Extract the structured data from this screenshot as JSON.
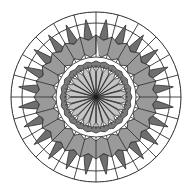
{
  "figure": {
    "title": "Radial Mandala Rosette Diagram",
    "kind": "radial-polar-rosette",
    "width": 193,
    "height": 192,
    "background": "#ffffff",
    "center": {
      "x": 96,
      "y": 97
    },
    "segments": 24,
    "stroke_color": "#2b2b2b",
    "stroke_width": 0.9
  },
  "palette": {
    "white": "#ffffff",
    "light_gray": "#c4c4c4",
    "mid_gray": "#9a9a9a",
    "dark_gray": "#7a7a7a",
    "outline": "#2b2b2b",
    "spike_fill": "#6f6f6f"
  },
  "rings": [
    {
      "name": "outer-boundary-ring",
      "label": "Outer boundary circle",
      "inner_radius": 74,
      "outer_radius": 85,
      "fill": "#ffffff",
      "has_radial_dividers": true,
      "divider_count": 24
    },
    {
      "name": "spike-band",
      "label": "Outward pointing spike band",
      "inner_radius": 58,
      "outer_radius": 78,
      "fill": "#6f6f6f",
      "spike_count": 24,
      "spike_tip_radius": 78,
      "spike_base_radius": 58
    },
    {
      "name": "scalloped-annulus",
      "label": "Scalloped mid gray annulus",
      "inner_radius": 40,
      "outer_radius": 62,
      "fill": "#9a9a9a",
      "scallop_count": 24
    },
    {
      "name": "white-gap-ring",
      "label": "White separation gap",
      "inner_radius": 34,
      "outer_radius": 42,
      "fill": "#ffffff"
    },
    {
      "name": "inner-dark-ring",
      "label": "Inner dark ring",
      "inner_radius": 30,
      "outer_radius": 36,
      "fill": "#7a7a7a"
    },
    {
      "name": "center-rosette",
      "label": "Central light gray petal rosette",
      "inner_radius": 0,
      "outer_radius": 32,
      "fill": "#c4c4c4",
      "petal_count": 24
    }
  ],
  "chart_data": {
    "type": "area",
    "title": "Radial Mandala Rosette Diagram",
    "subtitle": "",
    "xlabel": "",
    "ylabel": "",
    "grid": true,
    "legend": "none",
    "categories": [
      "0",
      "15",
      "30",
      "45",
      "60",
      "75",
      "90",
      "105",
      "120",
      "135",
      "150",
      "165",
      "180",
      "195",
      "210",
      "225",
      "240",
      "255",
      "270",
      "285",
      "300",
      "315",
      "330",
      "345"
    ],
    "xlim": [
      0,
      360
    ],
    "ylim": [
      0,
      86
    ],
    "series": [
      {
        "name": "outer-boundary",
        "color": "#ffffff",
        "values": [
          85,
          85,
          85,
          85,
          85,
          85,
          85,
          85,
          85,
          85,
          85,
          85,
          85,
          85,
          85,
          85,
          85,
          85,
          85,
          85,
          85,
          85,
          85,
          85
        ]
      },
      {
        "name": "spike-band-tips",
        "color": "#6f6f6f",
        "values": [
          78,
          58,
          78,
          58,
          78,
          58,
          78,
          58,
          78,
          58,
          78,
          58,
          78,
          58,
          78,
          58,
          78,
          58,
          78,
          58,
          78,
          58,
          78,
          58
        ]
      },
      {
        "name": "scalloped-annulus",
        "color": "#9a9a9a",
        "values": [
          62,
          58,
          62,
          58,
          62,
          58,
          62,
          58,
          62,
          58,
          62,
          58,
          62,
          58,
          62,
          58,
          62,
          58,
          62,
          58,
          62,
          58,
          62,
          58
        ]
      },
      {
        "name": "inner-dark-ring",
        "color": "#7a7a7a",
        "values": [
          36,
          36,
          36,
          36,
          36,
          36,
          36,
          36,
          36,
          36,
          36,
          36,
          36,
          36,
          36,
          36,
          36,
          36,
          36,
          36,
          36,
          36,
          36,
          36
        ]
      },
      {
        "name": "center-rosette-petals",
        "color": "#c4c4c4",
        "values": [
          32,
          26,
          32,
          26,
          32,
          26,
          32,
          26,
          32,
          26,
          32,
          26,
          32,
          26,
          32,
          26,
          32,
          26,
          32,
          26,
          32,
          26,
          32,
          26
        ]
      }
    ]
  }
}
